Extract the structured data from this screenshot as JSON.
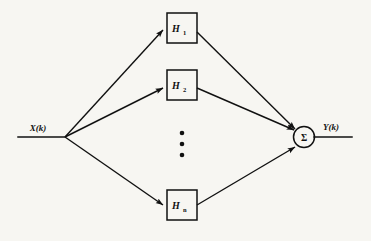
{
  "figure": {
    "kind": "block-diagram",
    "canvas": {
      "width": 371,
      "height": 241
    },
    "background_color": "#f7f6f2",
    "stroke_color": "#111111"
  },
  "signals": {
    "input": {
      "label": "X(k)",
      "label_x": 38,
      "label_y": 131,
      "line_x1": 18,
      "line_x2": 65,
      "line_y": 137
    },
    "output": {
      "label": "Y(k)",
      "label_x": 325,
      "label_y": 130,
      "line_x1": 314,
      "line_x2": 352,
      "line_y": 137
    }
  },
  "branch_node": {
    "x": 65,
    "y": 137
  },
  "blocks": [
    {
      "id": "h1",
      "base": "H",
      "subscript": "1",
      "x": 167,
      "y": 13,
      "width": 30,
      "height": 30
    },
    {
      "id": "h2",
      "base": "H",
      "subscript": "2",
      "x": 167,
      "y": 70,
      "width": 30,
      "height": 30
    },
    {
      "id": "hn",
      "base": "H",
      "subscript": "n",
      "x": 167,
      "y": 190,
      "width": 30,
      "height": 30
    }
  ],
  "ellipsis": {
    "label": "vertical-dots",
    "x": 182,
    "dot_ys": [
      133,
      144,
      155
    ],
    "radius": 2.3
  },
  "summing_node": {
    "symbol": "Σ",
    "cx": 304,
    "cy": 137,
    "r": 10.5,
    "text_x": 304,
    "text_y": 140.5
  },
  "connections": [
    {
      "from": "branch_node",
      "to": "h1",
      "x1": 65,
      "y1": 137,
      "x2": 163,
      "y2": 30
    },
    {
      "from": "branch_node",
      "to": "h2",
      "x1": 65,
      "y1": 137,
      "x2": 163,
      "y2": 88
    },
    {
      "from": "branch_node",
      "to": "hn",
      "x1": 65,
      "y1": 137,
      "x2": 163,
      "y2": 205
    },
    {
      "from": "h1",
      "to": "summing_node",
      "x1": 197,
      "y1": 32,
      "x2": 295,
      "y2": 129
    },
    {
      "from": "h2",
      "to": "summing_node",
      "x1": 197,
      "y1": 88,
      "x2": 294,
      "y2": 130
    },
    {
      "from": "hn",
      "to": "summing_node",
      "x1": 197,
      "y1": 205,
      "x2": 295,
      "y2": 147
    }
  ]
}
